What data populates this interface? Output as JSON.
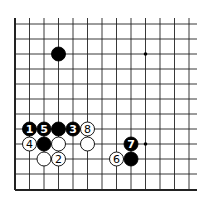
{
  "diagram": {
    "type": "go-board-fragment",
    "grid": {
      "x_lines": [
        15,
        29.5,
        44,
        58.5,
        73,
        87.5,
        102,
        116.5,
        131,
        145.5,
        160,
        174.5,
        189
      ],
      "y_lines": [
        24,
        39,
        54,
        69,
        84,
        99,
        114,
        129,
        144,
        159,
        174,
        190
      ],
      "top_extent": 18,
      "right_extent": 197,
      "edges": [
        "left",
        "bottom"
      ]
    },
    "star_points": [
      {
        "col": 9,
        "row": 2
      },
      {
        "col": 9,
        "row": 8
      }
    ],
    "stones": [
      {
        "color": "black",
        "col": 3,
        "row": 2,
        "label": ""
      },
      {
        "color": "black",
        "col": 1,
        "row": 7,
        "label": "1"
      },
      {
        "color": "white",
        "col": 3,
        "row": 9,
        "label": "2"
      },
      {
        "color": "black",
        "col": 4,
        "row": 7,
        "label": "3"
      },
      {
        "color": "white",
        "col": 1,
        "row": 8,
        "label": "4"
      },
      {
        "color": "black",
        "col": 2,
        "row": 7,
        "label": "5"
      },
      {
        "color": "white",
        "col": 7,
        "row": 9,
        "label": "6"
      },
      {
        "color": "black",
        "col": 8,
        "row": 8,
        "label": "7"
      },
      {
        "color": "white",
        "col": 5,
        "row": 7,
        "label": "8"
      },
      {
        "color": "black",
        "col": 3,
        "row": 7,
        "label": ""
      },
      {
        "color": "black",
        "col": 2,
        "row": 8,
        "label": ""
      },
      {
        "color": "white",
        "col": 3,
        "row": 8,
        "label": ""
      },
      {
        "color": "white",
        "col": 5,
        "row": 8,
        "label": ""
      },
      {
        "color": "white",
        "col": 2,
        "row": 9,
        "label": ""
      },
      {
        "color": "black",
        "col": 8,
        "row": 9,
        "label": ""
      }
    ]
  }
}
